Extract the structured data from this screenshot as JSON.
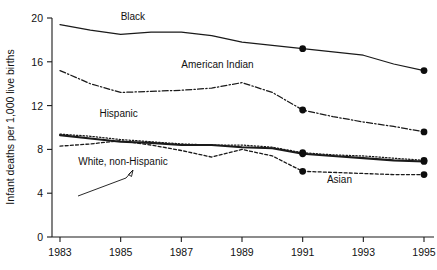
{
  "chart_data": {
    "type": "line",
    "title": "",
    "xlabel": "",
    "ylabel": "Infant deaths per 1,000 live births",
    "xlim": [
      1983,
      1995
    ],
    "ylim": [
      0,
      20
    ],
    "grid": false,
    "legend_position": "inline-labels",
    "x": [
      1983,
      1984,
      1985,
      1986,
      1987,
      1988,
      1989,
      1990,
      1991,
      1992,
      1993,
      1994,
      1995
    ],
    "xticks": [
      "1983",
      "1985",
      "1987",
      "1989",
      "1991",
      "1993",
      "1995"
    ],
    "xtick_values": [
      1983,
      1985,
      1987,
      1989,
      1991,
      1993,
      1995
    ],
    "yticks": [
      "0",
      "4",
      "8",
      "12",
      "16",
      "20"
    ],
    "ytick_values": [
      0,
      4,
      8,
      12,
      16,
      20
    ],
    "series": [
      {
        "name": "Black",
        "label": "Black",
        "style": "solid",
        "values": [
          19.4,
          18.9,
          18.5,
          18.7,
          18.7,
          18.4,
          17.8,
          17.5,
          17.2,
          16.9,
          16.6,
          15.8,
          15.2
        ],
        "markers_at": [
          1991,
          1995
        ],
        "label_x": 1985.0,
        "label_y": 19.8
      },
      {
        "name": "American Indian",
        "label": "American Indian",
        "style": "dashdot",
        "values": [
          15.2,
          14.0,
          13.2,
          13.3,
          13.4,
          13.6,
          14.1,
          13.2,
          11.6,
          11.0,
          10.5,
          10.1,
          9.6
        ],
        "markers_at": [
          1991,
          1995
        ],
        "label_x": 1987.0,
        "label_y": 15.4
      },
      {
        "name": "Hispanic",
        "label": "Hispanic",
        "style": "dotted",
        "values": [
          9.4,
          9.2,
          8.9,
          8.7,
          8.5,
          8.4,
          8.4,
          8.2,
          7.7,
          7.5,
          7.4,
          7.2,
          7.0
        ],
        "markers_at": [
          1991,
          1995
        ],
        "label_x": 1984.3,
        "label_y": 11.0
      },
      {
        "name": "White, non-Hispanic",
        "label": "White, non-Hispanic",
        "style": "solid-thick",
        "values": [
          9.3,
          9.0,
          8.7,
          8.6,
          8.4,
          8.4,
          8.2,
          8.1,
          7.6,
          7.4,
          7.2,
          7.0,
          6.9
        ],
        "markers_at": [
          1991,
          1995
        ],
        "label_x": 1983.6,
        "label_y": 6.6
      },
      {
        "name": "Asian",
        "label": "Asian",
        "style": "dashed",
        "values": [
          8.3,
          8.5,
          8.8,
          8.4,
          7.9,
          7.3,
          8.0,
          7.4,
          6.0,
          5.9,
          5.8,
          5.7,
          5.7
        ],
        "markers_at": [
          1991,
          1995
        ],
        "label_x": 1991.8,
        "label_y": 4.9
      }
    ]
  },
  "axis": {
    "y_title": "Infant deaths per 1,000 live births"
  },
  "labels": {
    "black": "Black",
    "american_indian": "American Indian",
    "hispanic": "Hispanic",
    "white_non_hispanic": "White, non-Hispanic",
    "asian": "Asian"
  },
  "colors": {
    "line": "#1a1a1a",
    "marker": "#0d0d0d",
    "background": "#ffffff",
    "text": "#111111"
  }
}
